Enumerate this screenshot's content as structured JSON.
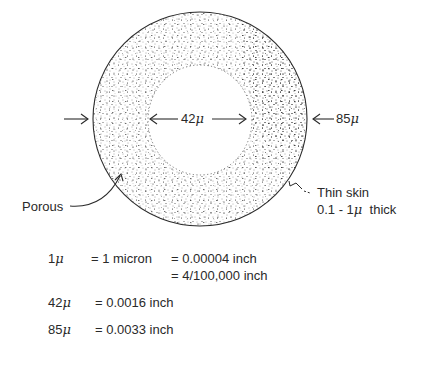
{
  "diagram": {
    "labels": {
      "inner_diameter": "42",
      "outer_diameter": "85",
      "mu_symbol": "μ",
      "porous": "Porous",
      "thin_skin_line1": "Thin skin",
      "thin_skin_line2_prefix": "0.1 - 1",
      "thin_skin_line2_suffix": "thick"
    },
    "conversions": [
      {
        "lhs_number": "1",
        "lhs_unit": "μ",
        "mid": "= 1 micron",
        "rhs": "= 0.00004 inch"
      },
      {
        "rhs": "= 4/100,000 inch"
      },
      {
        "lhs_number": "42",
        "lhs_unit": "μ",
        "rhs": "= 0.0016 inch"
      },
      {
        "lhs_number": "85",
        "lhs_unit": "μ",
        "rhs": "= 0.0033 inch"
      }
    ],
    "colors": {
      "ink": "#2a2a2a",
      "background": "#ffffff"
    }
  }
}
